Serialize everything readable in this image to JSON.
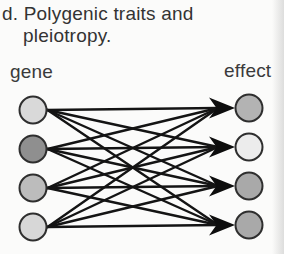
{
  "title": {
    "line1": "d. Polygenic traits and",
    "line2": "pleiotropy."
  },
  "diagram": {
    "left_column_label": "gene",
    "right_column_label": "effect",
    "gene_nodes": [
      {
        "name": "gene-1",
        "fill": "#d9d9d9"
      },
      {
        "name": "gene-2",
        "fill": "#8f8f8f"
      },
      {
        "name": "gene-3",
        "fill": "#bcbcbc"
      },
      {
        "name": "gene-4",
        "fill": "#d7d7d7"
      }
    ],
    "effect_nodes": [
      {
        "name": "effect-1",
        "fill": "#b3b3b3"
      },
      {
        "name": "effect-2",
        "fill": "#ececec"
      },
      {
        "name": "effect-3",
        "fill": "#a9a9a9"
      },
      {
        "name": "effect-4",
        "fill": "#a9a9a9"
      }
    ],
    "connectivity": "all-to-all",
    "edge_color": "#141414",
    "arrowhead_color": "#0d0d0d",
    "node_outline_color": "#2e2e2e"
  }
}
